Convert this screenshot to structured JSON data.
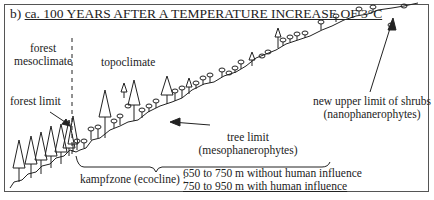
{
  "title": {
    "prefix": "b)",
    "text": "ca. 100 YEARS AFTER A TEMPERATURE INCREASE OF 3°C"
  },
  "labels": {
    "forest_mesoclimate_1": "forest",
    "forest_mesoclimate_2": "mesoclimate",
    "topoclimate": "topoclimate",
    "forest_limit": "forest limit",
    "tree_limit_1": "tree limit",
    "tree_limit_2": "(mesophanerophytes)",
    "shrub_limit_1": "new upper limit of shrubs",
    "shrub_limit_2": "(nanophanerophytes)",
    "kampfzone": "kampfzone (ecocline)",
    "kampfzone_sep": ":",
    "range_without": "650 to 750 m without human influence",
    "range_with": "750 to 950 m with human influence"
  },
  "icons": {
    "conifer": "conifer-tree-icon",
    "shrub": "shrub-icon",
    "arrow": "arrow-icon"
  },
  "colors": {
    "line": "#222222",
    "frame": "#555555",
    "background": "#ffffff"
  }
}
